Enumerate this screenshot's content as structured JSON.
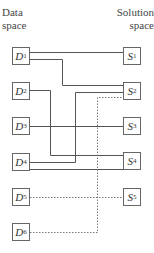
{
  "headers": {
    "data_space": "Data space",
    "solution_space": "Solution space"
  },
  "data_nodes": [
    {
      "letter": "D",
      "sub": "1",
      "y": 47
    },
    {
      "letter": "D",
      "sub": "2",
      "y": 82
    },
    {
      "letter": "D",
      "sub": "3",
      "y": 117
    },
    {
      "letter": "D",
      "sub": "4",
      "y": 153
    },
    {
      "letter": "D",
      "sub": "5",
      "y": 188
    },
    {
      "letter": "D",
      "sub": "6",
      "y": 223
    }
  ],
  "solution_nodes": [
    {
      "letter": "S",
      "sub": "1",
      "y": 47
    },
    {
      "letter": "S",
      "sub": "2",
      "y": 82
    },
    {
      "letter": "S",
      "sub": "3",
      "y": 117
    },
    {
      "letter": "S",
      "sub": "4",
      "y": 152
    },
    {
      "letter": "S",
      "sub": "5",
      "y": 188
    }
  ],
  "connections": [
    {
      "from": "D1",
      "to": "S1",
      "style": "solid"
    },
    {
      "from": "D1",
      "to": "S2",
      "style": "solid"
    },
    {
      "from": "D2",
      "to": "S4",
      "style": "solid"
    },
    {
      "from": "D3",
      "to": "S3",
      "style": "solid"
    },
    {
      "from": "D4",
      "to": "S2",
      "style": "solid"
    },
    {
      "from": "D4",
      "to": "S4",
      "style": "solid"
    },
    {
      "from": "D5",
      "to": "S5",
      "style": "dotted"
    },
    {
      "from": "D6",
      "to": "S2",
      "style": "dotted"
    }
  ],
  "colors": {
    "line": "#555555",
    "box_border": "#666666"
  }
}
